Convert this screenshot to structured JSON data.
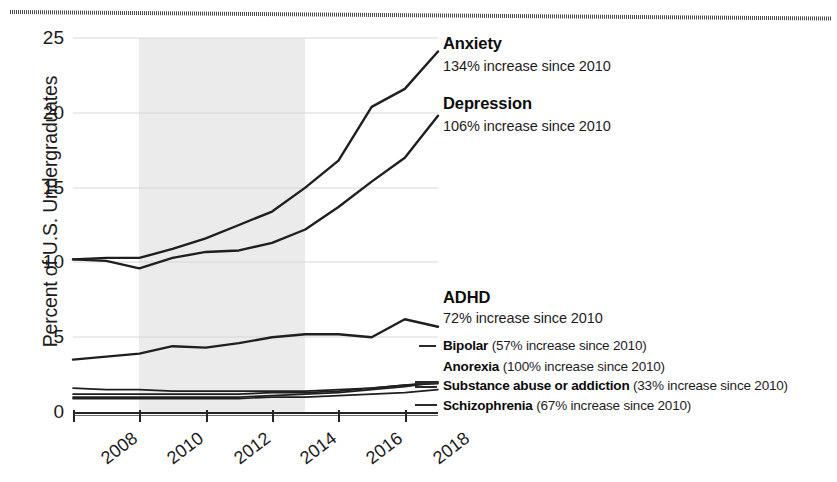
{
  "chart_data": {
    "type": "line",
    "title": "",
    "xlabel": "",
    "ylabel": "Percent of U.S. Undergraduates",
    "xlim": [
      2008,
      2019
    ],
    "ylim": [
      0,
      25
    ],
    "grid": true,
    "legend_position": "right-inline-annotations",
    "x_tick_labels": [
      "2008",
      "2010",
      "2012",
      "2014",
      "2016",
      "2018"
    ],
    "y_tick_labels": [
      "0",
      "5",
      "10",
      "15",
      "20",
      "25"
    ],
    "x": [
      2008,
      2009,
      2010,
      2011,
      2012,
      2013,
      2014,
      2015,
      2016,
      2017,
      2018,
      2019
    ],
    "shaded_region": {
      "label": "",
      "from": 2010,
      "to": 2015
    },
    "series": [
      {
        "name": "Anxiety",
        "annotation": "134% increase since 2010",
        "values": [
          10.2,
          10.3,
          10.3,
          10.9,
          11.6,
          12.5,
          13.4,
          15.0,
          16.8,
          20.4,
          21.6,
          24.1
        ]
      },
      {
        "name": "Depression",
        "annotation": "106% increase since 2010",
        "values": [
          10.2,
          10.1,
          9.6,
          10.3,
          10.7,
          10.8,
          11.3,
          12.2,
          13.7,
          15.4,
          17.0,
          19.8
        ]
      },
      {
        "name": "ADHD",
        "annotation": "72% increase since 2010",
        "values": [
          3.5,
          3.7,
          3.9,
          4.4,
          4.3,
          4.6,
          5.0,
          5.2,
          5.2,
          5.0,
          6.2,
          5.7
        ]
      },
      {
        "name": "Bipolar",
        "annotation": "(57% increase since 2010)",
        "values": [
          1.2,
          1.2,
          1.2,
          1.2,
          1.2,
          1.2,
          1.3,
          1.3,
          1.4,
          1.6,
          1.8,
          1.9
        ]
      },
      {
        "name": "Anorexia",
        "annotation": "(100% increase since 2010)",
        "values": [
          1.0,
          1.0,
          1.0,
          1.0,
          1.0,
          1.0,
          1.1,
          1.2,
          1.3,
          1.5,
          1.7,
          2.0
        ]
      },
      {
        "name": "Substance abuse or addiction",
        "annotation": "(33% increase since 2010)",
        "values": [
          1.6,
          1.5,
          1.5,
          1.4,
          1.4,
          1.4,
          1.4,
          1.4,
          1.5,
          1.6,
          1.8,
          2.0
        ]
      },
      {
        "name": "Schizophrenia",
        "annotation": "(67% increase since 2010)",
        "values": [
          0.9,
          0.9,
          0.9,
          0.9,
          0.9,
          0.9,
          1.0,
          1.0,
          1.1,
          1.2,
          1.3,
          1.5
        ]
      }
    ]
  },
  "axis": {
    "y_title": "Percent of U.S. Undergraduates",
    "y_ticks": [
      "25",
      "20",
      "15",
      "10",
      "5",
      "0"
    ],
    "x_ticks": [
      "2008",
      "2010",
      "2012",
      "2014",
      "2016",
      "2018"
    ]
  },
  "annotations": {
    "anxiety": {
      "title": "Anxiety",
      "sub": "134% increase since 2010"
    },
    "depression": {
      "title": "Depression",
      "sub": "106% increase since 2010"
    },
    "adhd": {
      "title": "ADHD",
      "sub": "72% increase since 2010"
    },
    "bipolar": {
      "name": "Bipolar",
      "sub": "(57% increase since 2010)"
    },
    "anorexia": {
      "name": "Anorexia",
      "sub": "(100% increase since 2010)"
    },
    "substance": {
      "name": "Substance abuse or addiction",
      "sub": "(33% increase since 2010)"
    },
    "schizophrenia": {
      "name": "Schizophrenia",
      "sub": "(67% increase since 2010)"
    }
  },
  "colors": {
    "line": "#1f1f1f",
    "grid": "#d8d8d8",
    "shade": "#e8e8e8",
    "text": "#111111"
  }
}
